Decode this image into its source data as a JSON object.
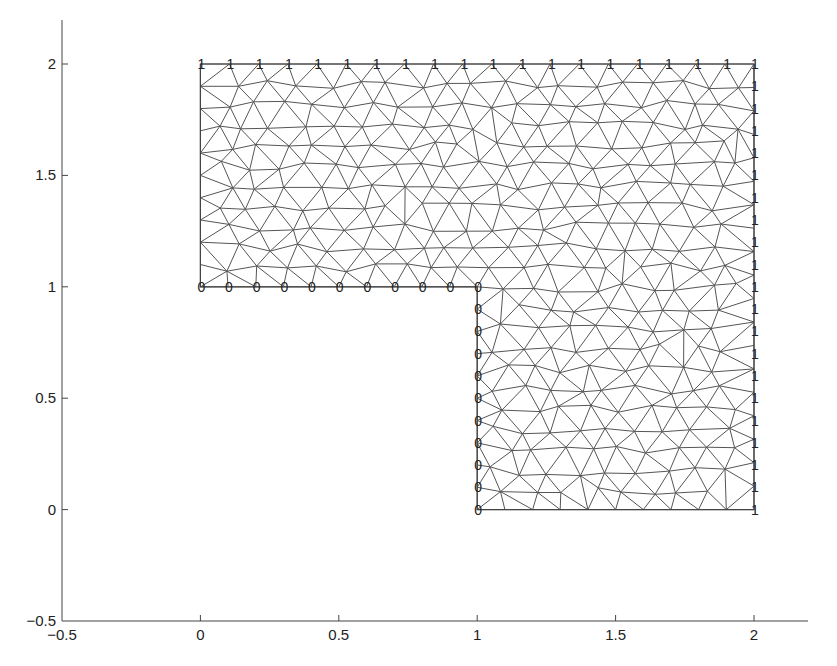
{
  "chart_data": {
    "type": "mesh",
    "title": "",
    "xlabel": "",
    "ylabel": "",
    "xlim": [
      -0.5,
      2.2
    ],
    "ylim": [
      -0.5,
      2.2
    ],
    "grid": false,
    "legend": null,
    "x_ticks": [
      -0.5,
      0,
      0.5,
      1,
      1.5,
      2
    ],
    "x_tick_labels": [
      "−0.5",
      "0",
      "0.5",
      "1",
      "1.5",
      "2"
    ],
    "y_ticks": [
      -0.5,
      0,
      0.5,
      1,
      1.5,
      2
    ],
    "y_tick_labels": [
      "−0.5",
      "0",
      "0.5",
      "1",
      "1.5",
      "2"
    ],
    "domain_polygon": [
      [
        0,
        2
      ],
      [
        2,
        2
      ],
      [
        2,
        0
      ],
      [
        1,
        0
      ],
      [
        1,
        1
      ],
      [
        0,
        1
      ]
    ],
    "mesh_spacing": 0.105,
    "boundary_labels": [
      {
        "edge": "top",
        "from": [
          0,
          2
        ],
        "to": [
          1.9,
          2
        ],
        "count": 19,
        "label": "1"
      },
      {
        "edge": "right",
        "from": [
          2,
          2
        ],
        "to": [
          2,
          0
        ],
        "count": 21,
        "label": "1"
      },
      {
        "edge": "inner-horizontal",
        "from": [
          0,
          1
        ],
        "to": [
          0.9,
          1
        ],
        "count": 10,
        "label": "0"
      },
      {
        "edge": "inner-vertical",
        "from": [
          1,
          1
        ],
        "to": [
          1,
          0
        ],
        "count": 11,
        "label": "0"
      }
    ],
    "line_color": "#555555",
    "label_color": "#222222"
  }
}
